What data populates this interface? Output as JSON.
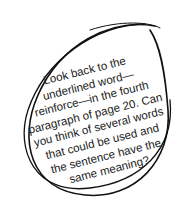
{
  "callout": {
    "lines": [
      "Look back to the",
      "underlined word—",
      "reinforce—in the fourth",
      "paragraph of page 20. Can",
      "you think of several words",
      "that could be used and",
      "the sentence have the",
      "same meaning?"
    ]
  },
  "colors": {
    "stroke": "#111111",
    "text": "#222222",
    "background": "#ffffff"
  }
}
